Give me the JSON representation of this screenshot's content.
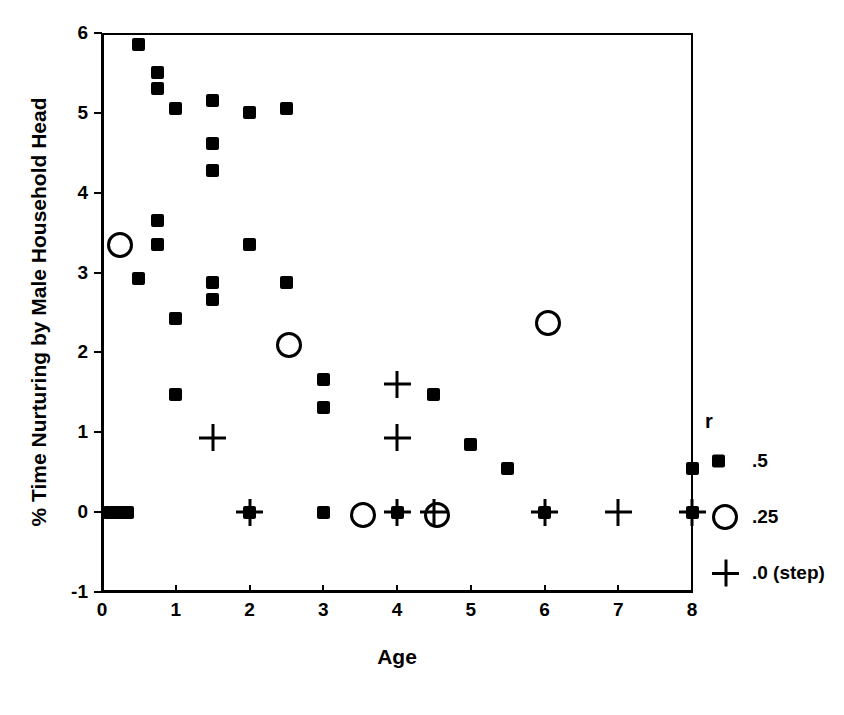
{
  "chart_data": {
    "type": "scatter",
    "title": "",
    "xlabel": "Age",
    "ylabel": "% Time Nurturing by Male Household Head",
    "xlim": [
      0,
      8
    ],
    "ylim": [
      -1,
      6
    ],
    "xticks": [
      "0",
      "1",
      "2",
      "3",
      "4",
      "5",
      "6",
      "7",
      "8"
    ],
    "yticks": [
      "6",
      "5",
      "4",
      "3",
      "2",
      "1",
      "0",
      "-1"
    ],
    "grid": false,
    "legend": {
      "title": "r",
      "position": "right-outside",
      "entries": [
        {
          "marker": "square",
          "label": ".5"
        },
        {
          "marker": "circle",
          "label": ".25"
        },
        {
          "marker": "plus",
          "label": ".0  (step)"
        }
      ]
    },
    "series": [
      {
        "name": ".5",
        "marker": "square",
        "points": [
          [
            0.1,
            0.0
          ],
          [
            0.18,
            0.0
          ],
          [
            0.26,
            0.0
          ],
          [
            0.34,
            0.0
          ],
          [
            0.5,
            5.85
          ],
          [
            0.5,
            2.93
          ],
          [
            0.75,
            5.5
          ],
          [
            0.75,
            5.3
          ],
          [
            0.75,
            3.65
          ],
          [
            0.75,
            3.35
          ],
          [
            1.0,
            5.05
          ],
          [
            1.0,
            2.43
          ],
          [
            1.0,
            1.47
          ],
          [
            1.5,
            5.15
          ],
          [
            1.5,
            4.62
          ],
          [
            1.5,
            4.28
          ],
          [
            1.5,
            2.88
          ],
          [
            1.5,
            2.66
          ],
          [
            2.0,
            5.0
          ],
          [
            2.0,
            3.35
          ],
          [
            2.0,
            0.0
          ],
          [
            2.5,
            5.05
          ],
          [
            2.5,
            2.88
          ],
          [
            3.0,
            1.66
          ],
          [
            3.0,
            1.31
          ],
          [
            3.0,
            0.0
          ],
          [
            4.0,
            0.0
          ],
          [
            4.5,
            1.47
          ],
          [
            5.0,
            0.85
          ],
          [
            5.5,
            0.55
          ],
          [
            6.0,
            0.0
          ],
          [
            8.0,
            0.55
          ],
          [
            8.0,
            0.0
          ]
        ]
      },
      {
        "name": ".25",
        "marker": "circle",
        "points": [
          [
            0.2,
            3.38
          ],
          [
            2.5,
            2.13
          ],
          [
            3.5,
            0.0
          ],
          [
            4.5,
            0.0
          ],
          [
            6.0,
            2.4
          ]
        ]
      },
      {
        "name": ".0 (step)",
        "marker": "plus",
        "points": [
          [
            1.5,
            0.93
          ],
          [
            2.0,
            0.0
          ],
          [
            4.0,
            1.6
          ],
          [
            4.0,
            0.93
          ],
          [
            4.0,
            0.0
          ],
          [
            4.5,
            0.0
          ],
          [
            6.0,
            0.0
          ],
          [
            7.0,
            0.0
          ],
          [
            8.0,
            0.0
          ]
        ]
      }
    ]
  },
  "colors": {
    "marker": "#000000",
    "axis": "#000000",
    "background": "#ffffff"
  }
}
